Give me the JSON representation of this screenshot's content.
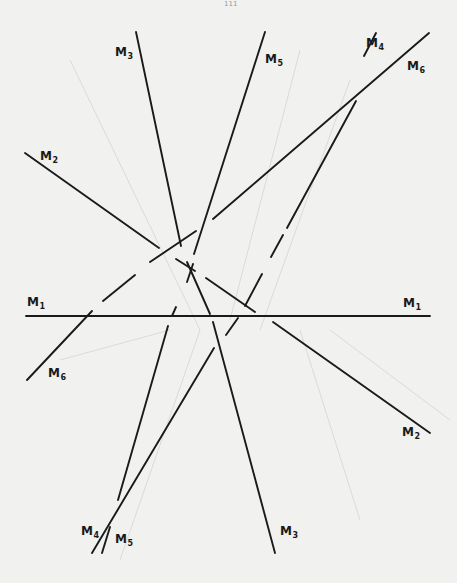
{
  "page": {
    "number": "111"
  },
  "diagram": {
    "line_color": "#1a1a1a",
    "background": "#f1f1ef",
    "lines": [
      {
        "id": "M1",
        "segments": [
          [
            26,
            316,
            430,
            316
          ]
        ]
      },
      {
        "id": "M2",
        "segments": [
          [
            25,
            153,
            159,
            248
          ],
          [
            176,
            259,
            195,
            271
          ],
          [
            206,
            278,
            255,
            312
          ],
          [
            273,
            322,
            430,
            433
          ]
        ]
      },
      {
        "id": "M3",
        "segments": [
          [
            136,
            32,
            181,
            246
          ],
          [
            187,
            262,
            210,
            314
          ],
          [
            213,
            322,
            275,
            553
          ]
        ]
      },
      {
        "id": "M4",
        "segments": [
          [
            376,
            33,
            364,
            56
          ],
          [
            356,
            101,
            287,
            228
          ],
          [
            283,
            235,
            271,
            257
          ],
          [
            262,
            274,
            245,
            306
          ],
          [
            238,
            318,
            226,
            335
          ],
          [
            214,
            348,
            92,
            553
          ]
        ]
      },
      {
        "id": "M5",
        "segments": [
          [
            265,
            32,
            194,
            254
          ],
          [
            193,
            264,
            187,
            282
          ],
          [
            176,
            307,
            172,
            316
          ],
          [
            168,
            326,
            118,
            500
          ],
          [
            110,
            527,
            102,
            553
          ]
        ]
      },
      {
        "id": "M6",
        "segments": [
          [
            429,
            33,
            213,
            219
          ],
          [
            196,
            231,
            150,
            262
          ],
          [
            135,
            275,
            103,
            301
          ],
          [
            92,
            311,
            27,
            380
          ]
        ]
      }
    ],
    "labels": [
      {
        "text": "M",
        "sub": "1",
        "x": 27,
        "y": 296,
        "name": "label-m1-left"
      },
      {
        "text": "M",
        "sub": "1",
        "x": 403,
        "y": 297,
        "name": "label-m1-right"
      },
      {
        "text": "M",
        "sub": "2",
        "x": 40,
        "y": 150,
        "name": "label-m2-top"
      },
      {
        "text": "M",
        "sub": "2",
        "x": 402,
        "y": 426,
        "name": "label-m2-bottom"
      },
      {
        "text": "M",
        "sub": "3",
        "x": 115,
        "y": 46,
        "name": "label-m3-top"
      },
      {
        "text": "M",
        "sub": "3",
        "x": 280,
        "y": 525,
        "name": "label-m3-bottom"
      },
      {
        "text": "M",
        "sub": "4",
        "x": 366,
        "y": 37,
        "name": "label-m4-top"
      },
      {
        "text": "M",
        "sub": "4",
        "x": 81,
        "y": 525,
        "name": "label-m4-bottom"
      },
      {
        "text": "M",
        "sub": "5",
        "x": 265,
        "y": 53,
        "name": "label-m5-top"
      },
      {
        "text": "M",
        "sub": "5",
        "x": 115,
        "y": 533,
        "name": "label-m5-bottom"
      },
      {
        "text": "M",
        "sub": "6",
        "x": 407,
        "y": 60,
        "name": "label-m6-top"
      },
      {
        "text": "M",
        "sub": "6",
        "x": 48,
        "y": 367,
        "name": "label-m6-bottom"
      }
    ],
    "faint_guides": [
      [
        70,
        60,
        200,
        330
      ],
      [
        300,
        50,
        230,
        320
      ],
      [
        350,
        80,
        260,
        330
      ],
      [
        200,
        330,
        120,
        560
      ],
      [
        300,
        330,
        360,
        520
      ],
      [
        330,
        330,
        450,
        420
      ],
      [
        60,
        360,
        170,
        330
      ]
    ]
  }
}
